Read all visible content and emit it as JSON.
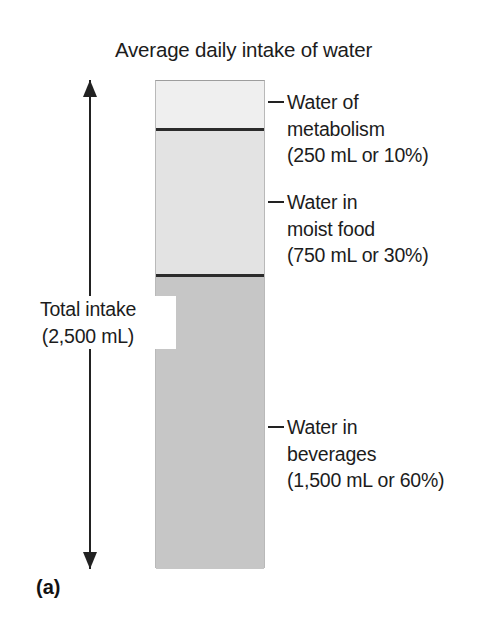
{
  "figure": {
    "title": "Average daily intake of water",
    "panel_letter": "(a)",
    "total": {
      "label_line1": "Total intake",
      "label_line2": "(2,500 mL)",
      "value_ml": 2500
    }
  },
  "callouts": {
    "metabolism": {
      "line1": "Water of",
      "line2": "metabolism",
      "line3": "(250 mL or 10%)"
    },
    "moist_food": {
      "line1": "Water in",
      "line2": "moist food",
      "line3": "(750 mL or 30%)"
    },
    "beverages": {
      "line1": "Water in",
      "line2": "beverages",
      "line3": "(1,500 mL or 60%)"
    }
  },
  "colors": {
    "segment_metabolism": "#efefef",
    "segment_moist_food": "#e3e3e3",
    "segment_beverages": "#c6c6c6",
    "divider": "#2b2b2b",
    "text": "#1c1c1c",
    "arrow": "#222222",
    "background": "#ffffff"
  },
  "chart_data": {
    "type": "bar",
    "title": "Average daily intake of water",
    "subtitle": "",
    "xlabel": "",
    "ylabel": "",
    "orientation": "vertical-stacked",
    "total_label": "Total intake (2,500 mL)",
    "total_value": 2500,
    "units": "mL",
    "categories": [
      "Water of metabolism",
      "Water in moist food",
      "Water in beverages"
    ],
    "values": [
      250,
      750,
      1500
    ],
    "percentages": [
      10,
      30,
      60
    ],
    "value_labels": [
      "(250 mL or 10%)",
      "(750 mL or 30%)",
      "(1,500 mL or 60%)"
    ],
    "stack_order_top_to_bottom": [
      "Water of metabolism",
      "Water in moist food",
      "Water in beverages"
    ],
    "segment_colors": [
      "#efefef",
      "#e3e3e3",
      "#c6c6c6"
    ],
    "ylim": [
      0,
      2500
    ],
    "grid": false,
    "legend": "none",
    "annotations": [
      "(a)"
    ]
  }
}
